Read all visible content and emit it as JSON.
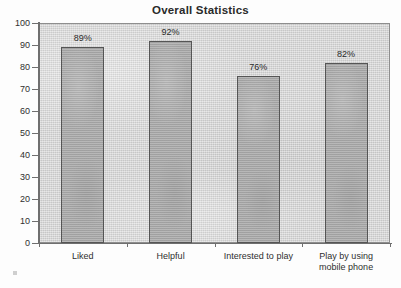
{
  "chart_data": {
    "type": "bar",
    "title": "Overall Statistics",
    "xlabel": "",
    "ylabel": "",
    "ylim": [
      0,
      100
    ],
    "ytick_step": 10,
    "ytick_labels": [
      "100",
      "90",
      "80",
      "70",
      "60",
      "50",
      "40",
      "30",
      "20",
      "10",
      "0"
    ],
    "grid": false,
    "legend": false,
    "categories": [
      "Liked",
      "Helpful",
      "Interested to play",
      "Play by using\nmobile phone"
    ],
    "values": [
      89,
      92,
      76,
      82
    ],
    "data_labels": [
      "89%",
      "92%",
      "76%",
      "82%"
    ],
    "colors": {
      "bar_fill": "#a9a9a9",
      "bar_border": "#555555",
      "plot_background": "#d4d4d4",
      "plot_border": "#8e8e8e",
      "axis": "#6f6f6f",
      "text": "#2f2f2f",
      "page_background": "#fdfdfd"
    }
  }
}
